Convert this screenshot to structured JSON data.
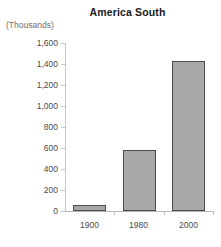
{
  "chart_data": {
    "type": "bar",
    "title": "America South",
    "subtitle": "",
    "unit_label": "(Thousands)",
    "xlabel": "",
    "ylabel": "",
    "categories": [
      "1900",
      "1980",
      "2000"
    ],
    "values": [
      60,
      580,
      1430
    ],
    "series": [
      {
        "name": "America South",
        "values": [
          60,
          580,
          1430
        ]
      }
    ],
    "ylim": [
      0,
      1600
    ],
    "ytick_values": [
      0,
      200,
      400,
      600,
      800,
      1000,
      1200,
      1400,
      1600
    ],
    "ytick_labels": [
      "0",
      "200",
      "400",
      "600",
      "800",
      "1,000",
      "1,200",
      "1,400",
      "1,600"
    ],
    "grid": false,
    "legend": "none",
    "bar_color": "#a8a8a8",
    "bar_border_color": "#4d4d4d",
    "axis_color": "#c8c8c8",
    "text_color": "#4a4a4a",
    "title_color": "#1a1a1a",
    "unit_label_color": "#6e6e6e",
    "background_color": "#ffffff"
  }
}
